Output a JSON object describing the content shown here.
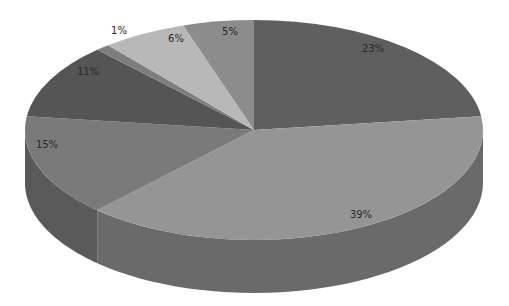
{
  "chart_data": {
    "type": "pie",
    "style": "3d",
    "title": "",
    "start_angle_deg": 0,
    "direction": "clockwise",
    "slices": [
      {
        "label": "23%",
        "value": 23,
        "color": "#5f5f5f",
        "side": "#4a4a4a",
        "label_pos": [
          373,
          52
        ]
      },
      {
        "label": "39%",
        "value": 39,
        "color": "#959595",
        "side": "#6a6a6a",
        "label_pos": [
          361,
          218
        ]
      },
      {
        "label": "15%",
        "value": 15,
        "color": "#7a7a7a",
        "side": "#5a5a5a",
        "label_pos": [
          47,
          148
        ]
      },
      {
        "label": "11%",
        "value": 11,
        "color": "#555555",
        "side": "#444444",
        "label_pos": [
          88,
          75
        ]
      },
      {
        "label": "1%",
        "value": 1,
        "color": "#7e7e7e",
        "side": "#5c5c5c",
        "label_pos": [
          119,
          34
        ]
      },
      {
        "label": "6%",
        "value": 6,
        "color": "#b8b8b8",
        "side": "#8c8c8c",
        "label_pos": [
          176,
          42
        ]
      },
      {
        "label": "5%",
        "value": 5,
        "color": "#8c8c8c",
        "side": "#666666",
        "label_pos": [
          230,
          35
        ]
      }
    ],
    "geometry": {
      "cx": 254,
      "cy": 130,
      "rx": 229,
      "ry": 110,
      "depth": 53
    },
    "legend": null
  }
}
